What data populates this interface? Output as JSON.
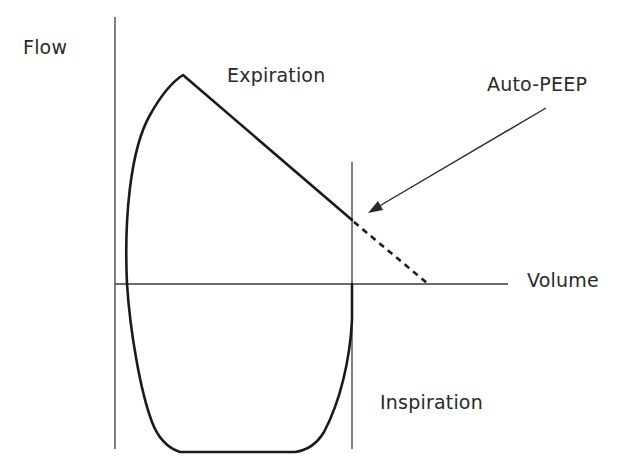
{
  "diagram": {
    "type": "flow-volume loop",
    "labels": {
      "y_axis": "Flow",
      "x_axis": "Volume",
      "upper_region": "Expiration",
      "lower_region": "Inspiration",
      "annotation": "Auto-PEEP"
    },
    "elements": [
      {
        "id": "flow-axis",
        "kind": "vertical axis line"
      },
      {
        "id": "volume-axis",
        "kind": "horizontal axis line"
      },
      {
        "id": "end-volume-line",
        "kind": "vertical reference line at end-expiratory volume"
      },
      {
        "id": "expiratory-limb",
        "kind": "solid curve rising to peak flow then linear decline"
      },
      {
        "id": "auto-peep-extrapolation",
        "kind": "dashed line extrapolating expiratory flow to zero"
      },
      {
        "id": "inspiratory-limb",
        "kind": "solid U-shaped curve below volume axis"
      },
      {
        "id": "auto-peep-arrow",
        "kind": "arrow pointing to non-zero end-expiratory flow"
      }
    ],
    "colors": {
      "line": "#1a1a1a",
      "axis": "#3a3a3a",
      "text": "#2a2a2a",
      "background": "#ffffff"
    }
  }
}
